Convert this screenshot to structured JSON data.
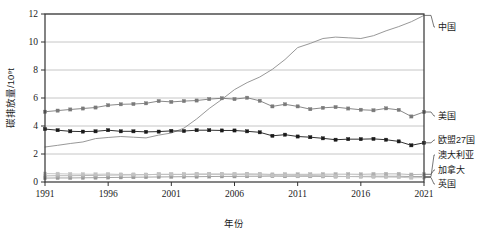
{
  "chart_data": {
    "type": "line",
    "title": "",
    "xlabel": "年份",
    "ylabel": "碳排放量/10⁹t",
    "xlim": [
      1991,
      2021
    ],
    "ylim": [
      0,
      12
    ],
    "yticks": [
      0,
      2,
      4,
      6,
      8,
      10,
      12
    ],
    "ytick_labels": [
      "0",
      "2",
      "4",
      "6",
      "8",
      "10",
      "12"
    ],
    "xticks": [
      1991,
      1996,
      2001,
      2006,
      2011,
      2016,
      2021
    ],
    "xtick_labels": [
      "1991",
      "1996",
      "2001",
      "2006",
      "2011",
      "2016",
      "2021"
    ],
    "grid": "horizontal",
    "legend_position": "right-outside",
    "x": [
      1991,
      1992,
      1993,
      1994,
      1995,
      1996,
      1997,
      1998,
      1999,
      2000,
      2001,
      2002,
      2003,
      2004,
      2005,
      2006,
      2007,
      2008,
      2009,
      2010,
      2011,
      2012,
      2013,
      2014,
      2015,
      2016,
      2017,
      2018,
      2019,
      2020,
      2021
    ],
    "series": [
      {
        "name": "中国",
        "color": "#8c8c8c",
        "marker": "none",
        "values": [
          2.5,
          2.62,
          2.75,
          2.86,
          3.1,
          3.18,
          3.25,
          3.2,
          3.15,
          3.35,
          3.5,
          3.85,
          4.5,
          5.25,
          5.9,
          6.6,
          7.1,
          7.5,
          8.05,
          8.75,
          9.6,
          9.9,
          10.25,
          10.35,
          10.3,
          10.25,
          10.45,
          10.8,
          11.1,
          11.45,
          11.9
        ]
      },
      {
        "name": "美国",
        "color": "#7a7a7a",
        "marker": "square",
        "values": [
          5.02,
          5.1,
          5.18,
          5.25,
          5.32,
          5.48,
          5.55,
          5.57,
          5.62,
          5.78,
          5.72,
          5.78,
          5.82,
          5.92,
          5.98,
          5.92,
          6.02,
          5.8,
          5.4,
          5.55,
          5.4,
          5.2,
          5.3,
          5.35,
          5.25,
          5.16,
          5.12,
          5.26,
          5.15,
          4.68,
          5.0
        ]
      },
      {
        "name": "欧盟27国",
        "color": "#1a1a1a",
        "marker": "square",
        "values": [
          3.78,
          3.7,
          3.62,
          3.6,
          3.62,
          3.7,
          3.62,
          3.62,
          3.58,
          3.6,
          3.65,
          3.64,
          3.7,
          3.7,
          3.68,
          3.68,
          3.62,
          3.55,
          3.3,
          3.38,
          3.25,
          3.2,
          3.12,
          3.02,
          3.06,
          3.06,
          3.08,
          3.02,
          2.9,
          2.62,
          2.8
        ]
      },
      {
        "name": "澳大利亚",
        "color": "#9a9a9a",
        "marker": "square",
        "values": [
          0.28,
          0.29,
          0.29,
          0.3,
          0.31,
          0.32,
          0.33,
          0.34,
          0.35,
          0.36,
          0.37,
          0.38,
          0.38,
          0.39,
          0.4,
          0.4,
          0.41,
          0.41,
          0.42,
          0.41,
          0.41,
          0.41,
          0.4,
          0.39,
          0.39,
          0.4,
          0.41,
          0.41,
          0.41,
          0.39,
          0.39
        ]
      },
      {
        "name": "加拿大",
        "color": "#b0b0b0",
        "marker": "square",
        "values": [
          0.44,
          0.45,
          0.45,
          0.46,
          0.47,
          0.49,
          0.5,
          0.51,
          0.52,
          0.55,
          0.54,
          0.55,
          0.57,
          0.57,
          0.57,
          0.56,
          0.58,
          0.57,
          0.54,
          0.55,
          0.55,
          0.55,
          0.56,
          0.56,
          0.56,
          0.55,
          0.57,
          0.58,
          0.58,
          0.53,
          0.55
        ]
      },
      {
        "name": "英国",
        "color": "#c2c2c2",
        "marker": "square",
        "values": [
          0.6,
          0.59,
          0.57,
          0.56,
          0.55,
          0.57,
          0.54,
          0.54,
          0.53,
          0.54,
          0.55,
          0.53,
          0.54,
          0.54,
          0.54,
          0.54,
          0.53,
          0.52,
          0.47,
          0.49,
          0.45,
          0.47,
          0.45,
          0.41,
          0.39,
          0.37,
          0.36,
          0.35,
          0.34,
          0.3,
          0.32
        ]
      }
    ]
  },
  "legend": {
    "items": [
      {
        "label": "中国"
      },
      {
        "label": "美国"
      },
      {
        "label": "欧盟27国"
      },
      {
        "label": "澳大利亚"
      },
      {
        "label": "加拿大"
      },
      {
        "label": "英国"
      }
    ]
  },
  "axes": {
    "y_title": "碳排放量/10⁹t",
    "x_title": "年份"
  },
  "colors": {
    "plot_border": "#333333",
    "gridline": "#b8b8b8",
    "background": "#ffffff"
  }
}
